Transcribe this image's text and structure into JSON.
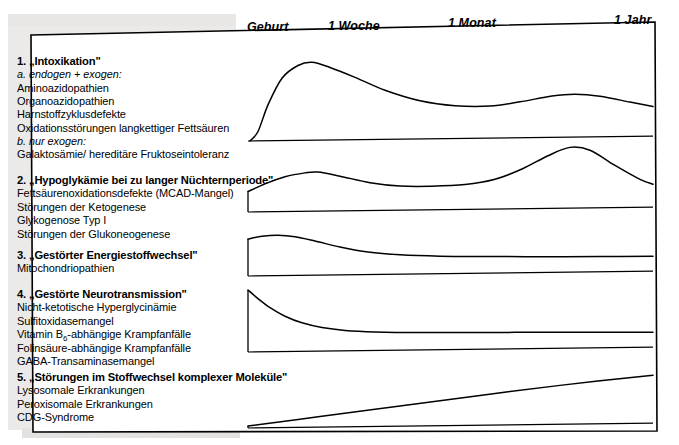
{
  "figure": {
    "title_present": false,
    "timeline": {
      "labels": [
        {
          "text": "Geburt",
          "x": 247
        },
        {
          "text": "1 Woche",
          "x": 328
        },
        {
          "text": "1 Monat",
          "x": 448
        },
        {
          "text": "1 Jahr",
          "x": 614
        }
      ]
    },
    "groups": [
      {
        "id": "intoxikation",
        "title": "1. „Intoxikation\"",
        "subheads": [
          {
            "after_items": 0,
            "text": "a. endogen + exogen:"
          },
          {
            "after_items": 4,
            "text": "b. nur exogen:"
          }
        ],
        "items": [
          "Aminoazidopathien",
          "Organoazidopathien",
          "Harnstoffzyklusdefekte",
          "Oxidationsstörungen langkettiger Fettsäuren",
          "Galaktosämie/ hereditäre Fruktoseintoleranz"
        ]
      },
      {
        "id": "hypoglykaemie",
        "title": "2. „Hypoglykämie bei zu langer Nüchternperiode\"",
        "subheads": [],
        "items": [
          "Fettsäurenoxidationsdefekte (MCAD-Mangel)",
          "Störungen der Ketogenese",
          "Glykogenose Typ I",
          "Störungen der Glukoneogenese"
        ]
      },
      {
        "id": "energiestoffwechsel",
        "title": "3. „Gestörter Energiestoffwechsel\"",
        "subheads": [],
        "items": [
          "Mitochondriopathien"
        ]
      },
      {
        "id": "neurotransmission",
        "title": "4. „Gestörte Neurotransmission\"",
        "subheads": [],
        "items": [
          "Nicht-ketotische Hyperglycinämie",
          "Sulfitoxidasemangel",
          "Vitamin B6-abhängige Krampfanfälle",
          "Folinsäure-abhängige Krampfanfälle",
          "GABA-Transaminasemangel"
        ]
      },
      {
        "id": "komplexe-molekuele",
        "title": "5. „Störungen im Stoffwechsel komplexer Moleküle\"",
        "subheads": [],
        "items": [
          "Lysosomale Erkrankungen",
          "Peroxisomale Erkrankungen",
          "CDG-Syndrome"
        ]
      }
    ]
  },
  "chart_data": {
    "type": "line",
    "title": "",
    "xlabel": "",
    "ylabel": "",
    "x_axis_kind": "logarithmic-age",
    "x_tick_labels": [
      "Geburt",
      "1 Woche",
      "1 Monat",
      "1 Jahr"
    ],
    "x_tick_positions_px": [
      250,
      330,
      450,
      630
    ],
    "grid": false,
    "legend": "none",
    "series": [
      {
        "name": "1. „Intoxikation\"",
        "baseline_y_px": 141,
        "comment": "starts at zero at birth, steep rise to an early sharp peak just after the first week, slow decay to a shallow trough around 1 month, small secondary rise, then mild decline",
        "points": [
          {
            "x": 250,
            "y": 0.0
          },
          {
            "x": 258,
            "y": 0.12
          },
          {
            "x": 268,
            "y": 0.46
          },
          {
            "x": 282,
            "y": 0.8
          },
          {
            "x": 298,
            "y": 0.96
          },
          {
            "x": 312,
            "y": 1.0
          },
          {
            "x": 330,
            "y": 0.93
          },
          {
            "x": 355,
            "y": 0.8
          },
          {
            "x": 385,
            "y": 0.63
          },
          {
            "x": 420,
            "y": 0.49
          },
          {
            "x": 455,
            "y": 0.42
          },
          {
            "x": 490,
            "y": 0.41
          },
          {
            "x": 520,
            "y": 0.46
          },
          {
            "x": 552,
            "y": 0.53
          },
          {
            "x": 575,
            "y": 0.55
          },
          {
            "x": 600,
            "y": 0.52
          },
          {
            "x": 630,
            "y": 0.44
          },
          {
            "x": 653,
            "y": 0.38
          }
        ]
      },
      {
        "name": "2. „Hypoglykämie bei zu langer Nüchternperiode\"",
        "baseline_y_px": 212,
        "comment": "moderate at birth, small early bump in the first weeks, dip around 1 month, then a tall late peak toward the end of the first year, declining at the right edge",
        "points": [
          {
            "x": 248,
            "y": 0.33
          },
          {
            "x": 265,
            "y": 0.45
          },
          {
            "x": 285,
            "y": 0.56
          },
          {
            "x": 305,
            "y": 0.62
          },
          {
            "x": 318,
            "y": 0.63
          },
          {
            "x": 340,
            "y": 0.56
          },
          {
            "x": 370,
            "y": 0.45
          },
          {
            "x": 400,
            "y": 0.39
          },
          {
            "x": 430,
            "y": 0.38
          },
          {
            "x": 465,
            "y": 0.4
          },
          {
            "x": 495,
            "y": 0.48
          },
          {
            "x": 522,
            "y": 0.64
          },
          {
            "x": 548,
            "y": 0.85
          },
          {
            "x": 570,
            "y": 0.98
          },
          {
            "x": 590,
            "y": 0.93
          },
          {
            "x": 615,
            "y": 0.68
          },
          {
            "x": 640,
            "y": 0.45
          },
          {
            "x": 653,
            "y": 0.37
          }
        ]
      },
      {
        "name": "3. „Gestörter Energiestoffwechsel\"",
        "baseline_y_px": 276,
        "comment": "elevated at birth with a slight early rise, then gradual decay to a low, nearly flat plateau from about one month onward",
        "points": [
          {
            "x": 248,
            "y": 0.82
          },
          {
            "x": 262,
            "y": 0.88
          },
          {
            "x": 278,
            "y": 0.9
          },
          {
            "x": 295,
            "y": 0.86
          },
          {
            "x": 315,
            "y": 0.76
          },
          {
            "x": 340,
            "y": 0.62
          },
          {
            "x": 368,
            "y": 0.5
          },
          {
            "x": 400,
            "y": 0.43
          },
          {
            "x": 440,
            "y": 0.39
          },
          {
            "x": 490,
            "y": 0.37
          },
          {
            "x": 545,
            "y": 0.35
          },
          {
            "x": 600,
            "y": 0.34
          },
          {
            "x": 653,
            "y": 0.33
          }
        ]
      },
      {
        "name": "4. „Gestörte Neurotransmission\"",
        "baseline_y_px": 352,
        "comment": "maximum immediately at birth, steep exponential decay through the first weeks to a low flat tail",
        "points": [
          {
            "x": 248,
            "y": 1.0
          },
          {
            "x": 258,
            "y": 0.86
          },
          {
            "x": 270,
            "y": 0.71
          },
          {
            "x": 285,
            "y": 0.57
          },
          {
            "x": 302,
            "y": 0.46
          },
          {
            "x": 322,
            "y": 0.38
          },
          {
            "x": 345,
            "y": 0.33
          },
          {
            "x": 375,
            "y": 0.3
          },
          {
            "x": 420,
            "y": 0.28
          },
          {
            "x": 480,
            "y": 0.27
          },
          {
            "x": 550,
            "y": 0.26
          },
          {
            "x": 610,
            "y": 0.25
          },
          {
            "x": 653,
            "y": 0.24
          }
        ]
      },
      {
        "name": "5. „Störungen im Stoffwechsel komplexer Moleküle\"",
        "baseline_y_px": 428,
        "comment": "near zero at birth, steady linear increase across the whole first year",
        "points": [
          {
            "x": 248,
            "y": 0.04
          },
          {
            "x": 320,
            "y": 0.22
          },
          {
            "x": 400,
            "y": 0.42
          },
          {
            "x": 480,
            "y": 0.62
          },
          {
            "x": 560,
            "y": 0.81
          },
          {
            "x": 653,
            "y": 1.0
          }
        ]
      }
    ]
  }
}
